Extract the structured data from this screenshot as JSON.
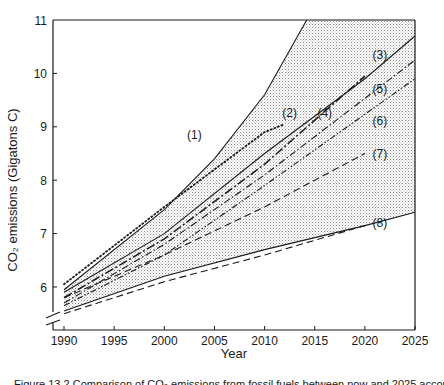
{
  "chart_data": {
    "type": "line",
    "title": "",
    "xlabel": "Year",
    "ylabel": "CO₂ emissions (Gigatons C)",
    "xlim": [
      1988.5,
      2025
    ],
    "ylim": [
      5.0,
      11
    ],
    "y_axis_break": true,
    "grid": false,
    "legend": "inline numbered labels",
    "x_ticks": [
      1990,
      1995,
      2000,
      2005,
      2010,
      2015,
      2020,
      2025
    ],
    "y_ticks": [
      6,
      7,
      8,
      9,
      10,
      11
    ],
    "shaded_region": {
      "description": "stippled range between upper envelope (1) and lower envelope (8)",
      "upper": [
        [
          1990,
          5.95
        ],
        [
          2000,
          7.45
        ],
        [
          2005,
          8.4
        ],
        [
          2010,
          9.6
        ],
        [
          2014.2,
          11.0
        ],
        [
          2025,
          11.0
        ]
      ],
      "lower": [
        [
          1990,
          5.55
        ],
        [
          2000,
          6.2
        ],
        [
          2010,
          6.7
        ],
        [
          2020,
          7.15
        ],
        [
          2025,
          7.4
        ]
      ]
    },
    "series": [
      {
        "name": "(1)",
        "style": "solid",
        "points": [
          [
            1990,
            5.95
          ],
          [
            2000,
            7.45
          ],
          [
            2005,
            8.4
          ],
          [
            2010,
            9.6
          ],
          [
            2014.2,
            11.0
          ]
        ]
      },
      {
        "name": "(2)",
        "style": "dotted",
        "points": [
          [
            1990,
            6.05
          ],
          [
            2000,
            7.5
          ],
          [
            2005,
            8.2
          ],
          [
            2010,
            8.9
          ],
          [
            2012,
            9.05
          ]
        ]
      },
      {
        "name": "(3)",
        "style": "solid",
        "points": [
          [
            1990,
            5.9
          ],
          [
            2000,
            7.0
          ],
          [
            2010,
            8.5
          ],
          [
            2020,
            9.9
          ],
          [
            2025,
            10.7
          ]
        ]
      },
      {
        "name": "(4)",
        "style": "dash-dot-heavy",
        "points": [
          [
            1990,
            5.8
          ],
          [
            2000,
            6.9
          ],
          [
            2010,
            8.3
          ],
          [
            2020,
            9.95
          ]
        ]
      },
      {
        "name": "(5)",
        "style": "dash-dot",
        "points": [
          [
            1990,
            5.7
          ],
          [
            2000,
            6.8
          ],
          [
            2010,
            8.1
          ],
          [
            2025,
            10.25
          ]
        ]
      },
      {
        "name": "(6)",
        "style": "dash-dot-dot",
        "points": [
          [
            1990,
            5.65
          ],
          [
            2000,
            6.6
          ],
          [
            2010,
            7.9
          ],
          [
            2025,
            9.9
          ]
        ]
      },
      {
        "name": "(7)",
        "style": "dashed",
        "points": [
          [
            1990,
            5.8
          ],
          [
            2000,
            6.6
          ],
          [
            2010,
            7.5
          ],
          [
            2020,
            8.5
          ]
        ]
      },
      {
        "name": "(8)",
        "style": "dashed",
        "points": [
          [
            1990,
            5.5
          ],
          [
            2000,
            6.1
          ],
          [
            2010,
            6.6
          ],
          [
            2020,
            7.15
          ]
        ]
      },
      {
        "name": "lower envelope",
        "style": "solid",
        "points": [
          [
            1990,
            5.55
          ],
          [
            2000,
            6.2
          ],
          [
            2010,
            6.7
          ],
          [
            2020,
            7.15
          ],
          [
            2025,
            7.4
          ]
        ]
      }
    ],
    "series_labels": [
      {
        "text": "(1)",
        "x": 2003,
        "y": 8.85
      },
      {
        "text": "(2)",
        "x": 2012.5,
        "y": 9.25
      },
      {
        "text": "(3)",
        "x": 2021.5,
        "y": 10.35
      },
      {
        "text": "(4)",
        "x": 2016,
        "y": 9.25
      },
      {
        "text": "(5)",
        "x": 2021.5,
        "y": 9.7
      },
      {
        "text": "(6)",
        "x": 2021.5,
        "y": 9.1
      },
      {
        "text": "(7)",
        "x": 2021.5,
        "y": 8.5
      },
      {
        "text": "(8)",
        "x": 2021.5,
        "y": 7.2
      }
    ]
  },
  "caption": "Figure 13.2  Comparison of CO₂ emissions from fossil fuels between now and 2025 according to different scenarios"
}
